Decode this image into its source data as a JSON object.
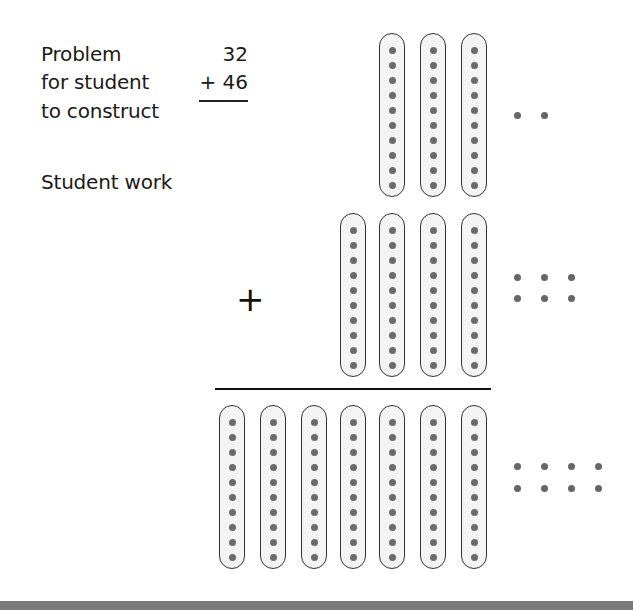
{
  "problem": {
    "label_lines": [
      "Problem",
      "for student",
      "to construct"
    ],
    "addend_top": "32",
    "addend_bottom": "+ 46",
    "student_work_label": "Student work"
  },
  "operator_symbol": "+",
  "colors": {
    "stick_border": "#333333",
    "stick_fill": "#f4f4f4",
    "dot": "#6b6b6b",
    "bottom_bar": "#7a7a7a"
  },
  "model": {
    "rows": [
      {
        "name": "first-addend",
        "tens": 3,
        "ones": 2,
        "value": 32
      },
      {
        "name": "second-addend",
        "tens": 4,
        "ones": 6,
        "value": 46
      },
      {
        "name": "sum",
        "tens": 7,
        "ones": 8,
        "value": 78
      }
    ],
    "dots_per_ten_stick": 10
  }
}
